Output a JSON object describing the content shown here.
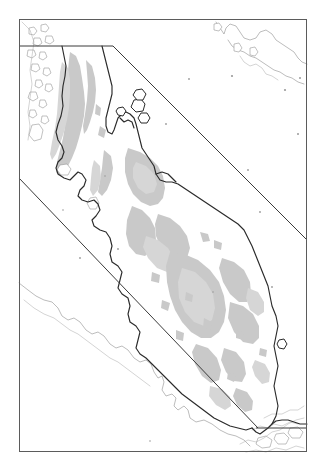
{
  "figure": {
    "kind": "map",
    "region": "Malay Peninsula (Thailand - Malaysia - Singapore)",
    "orientation": "north-up",
    "projection_hint": "equirectangular",
    "background_color": "#ffffff"
  },
  "frame": {
    "name": "map-neatline",
    "stroke_color": "#5b5b5b",
    "x": 19,
    "y": 19,
    "width": 288,
    "height": 433
  },
  "layers": [
    {
      "id": "study-area",
      "label": "Study area boundary",
      "style": "solid straight line",
      "stroke_color": "#3a3a3a",
      "stroke_width": 1
    },
    {
      "id": "coastline-primary",
      "label": "Mainland coastline",
      "style": "solid line",
      "stroke_color": "#2a2a2a",
      "stroke_width": 1.15
    },
    {
      "id": "coastline-secondary",
      "label": "Outer islands and secondary coast",
      "style": "thin solid line",
      "stroke_color": "#8e8e8e",
      "stroke_width": 0.6
    },
    {
      "id": "highland",
      "label": "Shaded interior (highland / forest cover)",
      "style": "filled polygon",
      "fill_color": "#c9c9c9"
    }
  ],
  "colors": {
    "paper": "#ffffff",
    "frame": "#5b5b5b",
    "study_boundary": "#3a3a3a",
    "coast_dark": "#2a2a2a",
    "coast_light": "#8e8e8e",
    "shade_gray": "#c9c9c9",
    "shade_gray_soft": "#d6d6d6"
  },
  "annotations": {
    "has_legend": false,
    "has_scale_bar": false,
    "has_north_arrow": false,
    "has_graticule_labels": false,
    "has_place_labels": false,
    "text_elements": []
  },
  "study_polygon": {
    "name": "study-area-polygon",
    "vertices_px": [
      [
        19,
        46
      ],
      [
        113,
        46
      ],
      [
        307,
        240
      ],
      [
        307,
        430
      ],
      [
        258,
        430
      ],
      [
        19,
        178
      ]
    ],
    "segments": [
      {
        "name": "north-edge",
        "from": [
          19,
          46
        ],
        "to": [
          113,
          46
        ],
        "type": "horizontal"
      },
      {
        "name": "northeast-diagonal",
        "from": [
          113,
          46
        ],
        "to": [
          307,
          240
        ],
        "type": "diagonal"
      },
      {
        "name": "southwest-diagonal",
        "from": [
          19,
          178
        ],
        "to": [
          258,
          428
        ],
        "type": "diagonal"
      },
      {
        "name": "south-edge",
        "from": [
          258,
          428
        ],
        "to": [
          307,
          428
        ],
        "type": "horizontal"
      }
    ]
  }
}
